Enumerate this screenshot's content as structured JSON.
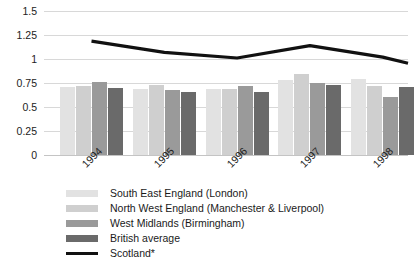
{
  "chart_data": {
    "type": "bar",
    "title": "",
    "subtitle": "",
    "xlabel": "",
    "ylabel": "",
    "categories": [
      "1994",
      "1995",
      "1996",
      "1997",
      "1998"
    ],
    "ylim": [
      0,
      1.5
    ],
    "y_ticks": [
      "0",
      "0.25",
      "0.5",
      "0.75",
      "1",
      "1.25",
      "1.5"
    ],
    "y_tick_values": [
      0,
      0.25,
      0.5,
      0.75,
      1,
      1.25,
      1.5
    ],
    "grid": true,
    "legend_position": "bottom-left",
    "series": [
      {
        "name": "South East England (London)",
        "type": "bar",
        "color": "#e2e2e2",
        "values": [
          0.71,
          0.685,
          0.685,
          0.78,
          0.79
        ]
      },
      {
        "name": "North West England (Manchester & Liverpool)",
        "type": "bar",
        "color": "#cfcfcf",
        "values": [
          0.72,
          0.725,
          0.685,
          0.845,
          0.72
        ]
      },
      {
        "name": "West Midlands (Birmingham)",
        "type": "bar",
        "color": "#9a9a9a",
        "values": [
          0.765,
          0.675,
          0.715,
          0.755,
          0.6
        ]
      },
      {
        "name": "British average",
        "type": "bar",
        "color": "#6a6a6a",
        "values": [
          0.7,
          0.66,
          0.66,
          0.725,
          0.71
        ]
      },
      {
        "name": "Scotland*",
        "type": "line",
        "color": "#111111",
        "values": [
          1.185,
          1.07,
          1.01,
          1.14,
          1.02
        ],
        "line_extends_past_last_category_to": 0.955
      }
    ]
  },
  "axes": {
    "y_tick_labels": [
      "1.5",
      "1.25",
      "1",
      "0.75",
      "0.5",
      "0.25",
      "0"
    ],
    "x_tick_labels": [
      "1994",
      "1995",
      "1996",
      "1997",
      "1998"
    ]
  },
  "legend": {
    "items": [
      {
        "label": "South East England (London)",
        "color": "#e2e2e2",
        "shape": "swatch"
      },
      {
        "label": "North West England (Manchester & Liverpool)",
        "color": "#cfcfcf",
        "shape": "swatch"
      },
      {
        "label": "West Midlands (Birmingham)",
        "color": "#9a9a9a",
        "shape": "swatch"
      },
      {
        "label": "British average",
        "color": "#6a6a6a",
        "shape": "swatch"
      },
      {
        "label": "Scotland*",
        "color": "#111111",
        "shape": "line"
      }
    ]
  }
}
